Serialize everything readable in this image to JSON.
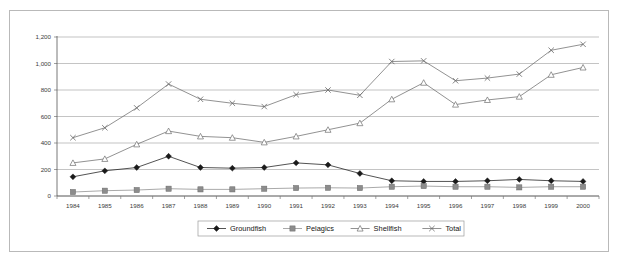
{
  "chart_data": {
    "type": "line",
    "title": "",
    "xlabel": "",
    "ylabel": "",
    "categories": [
      "1984",
      "1985",
      "1986",
      "1987",
      "1988",
      "1989",
      "1990",
      "1991",
      "1992",
      "1993",
      "1994",
      "1995",
      "1996",
      "1997",
      "1998",
      "1999",
      "2000"
    ],
    "ylim": [
      0,
      1200
    ],
    "ytick_values": [
      0,
      200,
      400,
      600,
      800,
      1000,
      1200
    ],
    "ytick_labels": [
      "0",
      "200",
      "400",
      "600",
      "800",
      "1,000",
      "1,200"
    ],
    "grid": true,
    "legend_position": "bottom",
    "series": [
      {
        "name": "Groundfish",
        "marker": "diamond",
        "color": "#1a1a1a",
        "values": [
          145,
          190,
          215,
          300,
          215,
          210,
          215,
          250,
          235,
          170,
          115,
          110,
          110,
          115,
          125,
          115,
          110
        ]
      },
      {
        "name": "Pelagics",
        "marker": "square",
        "color": "#8c8c8c",
        "values": [
          30,
          40,
          45,
          55,
          50,
          50,
          55,
          60,
          62,
          60,
          70,
          75,
          70,
          70,
          65,
          70,
          70
        ]
      },
      {
        "name": "Shellfish",
        "marker": "triangle",
        "color": "#6e6e6e",
        "values": [
          250,
          280,
          390,
          490,
          450,
          440,
          405,
          450,
          500,
          550,
          730,
          855,
          690,
          725,
          750,
          915,
          970
        ]
      },
      {
        "name": "Total",
        "marker": "cross",
        "color": "#6e6e6e",
        "values": [
          440,
          515,
          665,
          845,
          730,
          700,
          675,
          765,
          800,
          760,
          1015,
          1020,
          870,
          890,
          920,
          1100,
          1145
        ]
      }
    ]
  },
  "legend": {
    "items": [
      {
        "label": "Groundfish"
      },
      {
        "label": "Pelagics"
      },
      {
        "label": "Shellfish"
      },
      {
        "label": "Total"
      }
    ]
  },
  "colors": {
    "frame_border": "#b9b9b9",
    "gridline": "#9c9c9c",
    "axis": "#555555",
    "groundfish": "#1a1a1a",
    "pelagics": "#8c8c8c",
    "shellfish": "#6e6e6e",
    "total": "#6e6e6e",
    "background": "#ffffff"
  }
}
